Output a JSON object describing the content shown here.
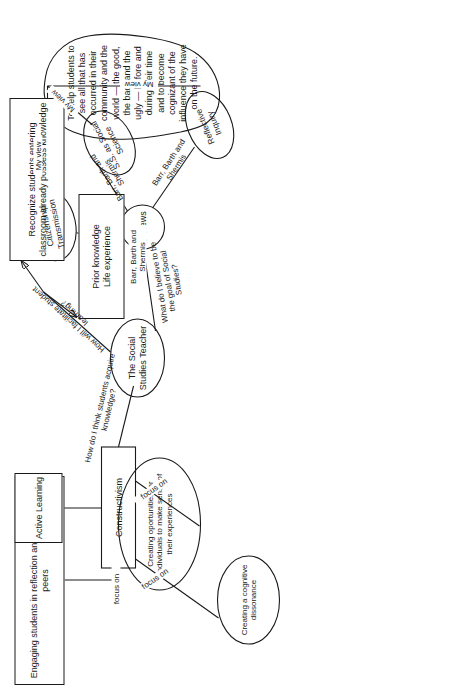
{
  "diagram": {
    "orientation": "rotated-90-counterclockwise",
    "stroke_color": "#1a1a1a",
    "background_color": "#ffffff"
  },
  "nodes": {
    "engaging_students": {
      "label": "Engaging students in reflection and dialogue with peers",
      "shape": "rectangle"
    },
    "active_learning": {
      "label": "Active Learning",
      "shape": "rectangle"
    },
    "constructivism": {
      "label": "Constructivism",
      "shape": "rectangle"
    },
    "cognitive_dissonance": {
      "label": "Creating a cognitive dissonance",
      "shape": "ellipse"
    },
    "make_sense": {
      "label": "Creating oportunities for individuals to make sense of their experiences",
      "shape": "ellipse"
    },
    "recognize_students": {
      "label": "Recognize students entering classroom already possess knowledge",
      "shape": "rectangle"
    },
    "prior_knowledge": {
      "label": "Prior knowledge\nLife experience",
      "shape": "rectangle"
    },
    "social_studies_teacher": {
      "label": "The Social Studies Teacher",
      "shape": "ellipse"
    },
    "three_views": {
      "label": "3 Views",
      "shape": "circle"
    },
    "citizenship_transmission": {
      "label": "Citizenship Transmission",
      "shape": "ellipse"
    },
    "ss_as_social_science": {
      "label": "S.S. as Social Science",
      "shape": "ellipse"
    },
    "reflective_inquiry": {
      "label": "Reflective Inquiry",
      "shape": "ellipse"
    },
    "my_goal_cloud": {
      "label": "To help students to see all that has occurred in their community and the world — the good, the bad, and the ugly — before and during their time and to become cognizant of the influence they have on the future.",
      "shape": "cloud"
    }
  },
  "edge_labels": {
    "focus_on_engaging": "focus on",
    "focus_on_dissonance": "focus on",
    "focus_on_make_sense": "focus on",
    "how_acquire_knowledge": "How do I think students acquire knowledge?",
    "how_facilitate_learning": "How will I facilitate student learning?",
    "what_is_goal": "What do I believe to be the goal of Social Studies?",
    "bbs_citizenship": "Barr, Barth and Shermis",
    "bbs_social_science": "Barr, Barth and Shermis",
    "bbs_reflective": "Barr, Barth and Shermis",
    "my_view_citizenship": "My view",
    "my_view_social_science": "My view",
    "my_view_reflective": "My view"
  }
}
